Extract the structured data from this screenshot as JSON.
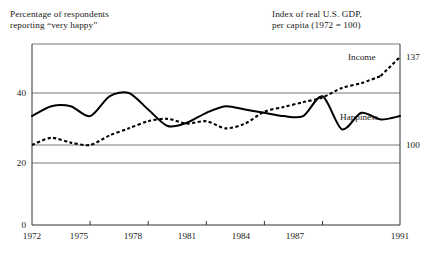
{
  "titles": {
    "left": "Percentage of respondents\nreporting “very happy”",
    "right": "Index of real U.S. GDP,\nper capita (1972 = 100)"
  },
  "series_labels": {
    "income": "Income",
    "happiness": "Happiness"
  },
  "axes": {
    "y_left_ticks": [
      "0",
      "20",
      "40"
    ],
    "y_right_ticks": [
      "100",
      "137"
    ],
    "x_ticks": [
      "1972",
      "1975",
      "1978",
      "1981",
      "1984",
      "1987",
      "1991"
    ]
  },
  "chart_data": {
    "type": "line",
    "title": "",
    "xlabel": "",
    "ylabel": "Percentage of respondents reporting “very happy”",
    "y2label": "Index of real U.S. GDP, per capita (1972 = 100)",
    "xlim": [
      1972,
      1991
    ],
    "ylim": [
      0,
      58
    ],
    "y2lim": [
      76.4,
      137
    ],
    "grid": true,
    "gridlines_y": [
      20,
      40,
      58
    ],
    "legend": "inline-annotations",
    "x": [
      1972,
      1973,
      1974,
      1975,
      1976,
      1977,
      1978,
      1979,
      1980,
      1981,
      1982,
      1983,
      1984,
      1985,
      1986,
      1987,
      1988,
      1989,
      1990,
      1991
    ],
    "series": [
      {
        "name": "Happiness",
        "axis": "left",
        "style": "solid",
        "unit": "percent",
        "values": [
          33,
          36,
          36,
          33,
          39,
          40,
          35,
          30,
          31,
          34,
          36,
          35,
          34,
          33,
          33,
          39,
          29,
          34,
          32,
          33
        ]
      },
      {
        "name": "Income",
        "axis": "right",
        "style": "dashed",
        "unit": "index",
        "values": [
          100,
          103,
          101,
          100,
          104,
          107,
          110,
          111,
          109,
          110,
          107,
          109,
          114,
          116,
          118,
          120,
          124,
          126,
          129,
          137
        ]
      }
    ],
    "annotations": [
      {
        "text": "Income",
        "x": 1988.6,
        "y2": 133
      },
      {
        "text": "Happiness",
        "x": 1988.0,
        "y": 25
      },
      {
        "text": "137",
        "x": 1991.6,
        "y2": 137
      },
      {
        "text": "100",
        "x": 1991.6,
        "y2": 100
      }
    ]
  }
}
